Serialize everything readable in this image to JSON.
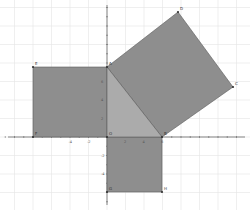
{
  "diagram": {
    "colors": {
      "background": "#ffffff",
      "grid": "#e4e4e4",
      "axis": "#555555",
      "square_fill": "#8e8e8e",
      "square_stroke": "#5a5a5a",
      "triangle_fill": "#ababab",
      "point": "#333333"
    },
    "origin_px": [
      107,
      137
    ],
    "unit_px": 18.5,
    "grid_spacing_px": 18.5,
    "x_tick_labels": [
      "-4",
      "-2",
      "2",
      "4",
      "6"
    ],
    "y_tick_labels": [
      "6",
      "4",
      "2",
      "-2",
      "-4"
    ],
    "points": [
      {
        "label": "O",
        "px": [
          107,
          137
        ]
      },
      {
        "label": "A",
        "px": [
          107,
          67
        ]
      },
      {
        "label": "B",
        "px": [
          162,
          137
        ]
      },
      {
        "label": "C",
        "px": [
          233,
          87
        ]
      },
      {
        "label": "D",
        "px": [
          178,
          12
        ]
      },
      {
        "label": "E",
        "px": [
          33,
          67
        ]
      },
      {
        "label": "F",
        "px": [
          33,
          137
        ]
      },
      {
        "label": "G",
        "px": [
          107,
          192
        ]
      },
      {
        "label": "H",
        "px": [
          162,
          192
        ]
      }
    ],
    "shapes": {
      "square_left": "33,67 107,67 107,137 33,137",
      "square_bottom": "107,137 162,137 162,192 107,192",
      "square_hypotenuse": "107,67 178,12 233,87 162,137",
      "triangle": "107,137 107,67 162,137"
    }
  }
}
